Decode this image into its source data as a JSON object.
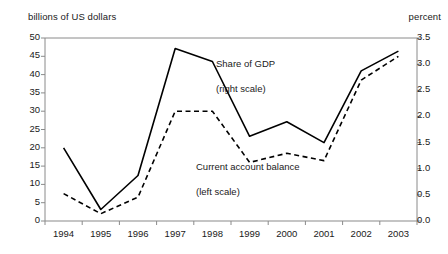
{
  "chart_data": {
    "type": "line",
    "title": "",
    "subtitle": "",
    "categories": [
      "1994",
      "1995",
      "1996",
      "1997",
      "1998",
      "1999",
      "2000",
      "2001",
      "2002",
      "2003"
    ],
    "x": [
      1994,
      1995,
      1996,
      1997,
      1998,
      1999,
      2000,
      2001,
      2002,
      2003
    ],
    "series": [
      {
        "name": "Share of GDP (right scale)",
        "axis": "right",
        "style": "solid",
        "color": "#000000",
        "unit": "percent",
        "values": [
          1.4,
          0.22,
          0.87,
          3.3,
          3.05,
          1.62,
          1.9,
          1.5,
          2.87,
          3.25
        ]
      },
      {
        "name": "Current account balance (left scale)",
        "axis": "left",
        "style": "dashed",
        "color": "#000000",
        "unit": "billions of US dollars",
        "values": [
          7.5,
          2.0,
          6.5,
          30.0,
          30.0,
          16.0,
          18.5,
          16.5,
          38.5,
          45.0
        ]
      }
    ],
    "left_axis": {
      "label": "billions of US dollars",
      "min": 0,
      "max": 50,
      "tick_step": 5,
      "ticks": [
        "0",
        "5",
        "10",
        "15",
        "20",
        "25",
        "30",
        "35",
        "40",
        "45",
        "50"
      ]
    },
    "right_axis": {
      "label": "percent",
      "min": 0.0,
      "max": 3.5,
      "tick_step": 0.5,
      "ticks": [
        "0.0",
        "0.5",
        "1.0",
        "1.5",
        "2.0",
        "2.5",
        "3.0",
        "3.5"
      ]
    },
    "xlabel": "",
    "grid": false,
    "legend_position": "inline-annotations",
    "annotations": [
      {
        "id": "solid",
        "line1": "Share of GDP",
        "line2": "(right scale)"
      },
      {
        "id": "dashed",
        "line1": "Current account balance",
        "line2": "(left scale)"
      }
    ]
  },
  "axes": {
    "left_unit": "billions of US dollars",
    "right_unit": "percent"
  },
  "ylabels_left": {
    "t0": "0",
    "t1": "5",
    "t2": "10",
    "t3": "15",
    "t4": "20",
    "t5": "25",
    "t6": "30",
    "t7": "35",
    "t8": "40",
    "t9": "45",
    "t10": "50"
  },
  "ylabels_right": {
    "t0": "0.0",
    "t1": "0.5",
    "t2": "1.0",
    "t3": "1.5",
    "t4": "2.0",
    "t5": "2.5",
    "t6": "3.0",
    "t7": "3.5"
  },
  "xlabels": {
    "x0": "1994",
    "x1": "1995",
    "x2": "1996",
    "x3": "1997",
    "x4": "1998",
    "x5": "1999",
    "x6": "2000",
    "x7": "2001",
    "x8": "2002",
    "x9": "2003"
  },
  "annotations": {
    "solid_line1": "Share of GDP",
    "solid_line2": "(right scale)",
    "dashed_line1": "Current account balance",
    "dashed_line2": "(left scale)"
  },
  "colors": {
    "series": "#000000",
    "axis": "#7a7a7a",
    "text": "#1a1a1a",
    "background": "#ffffff"
  }
}
